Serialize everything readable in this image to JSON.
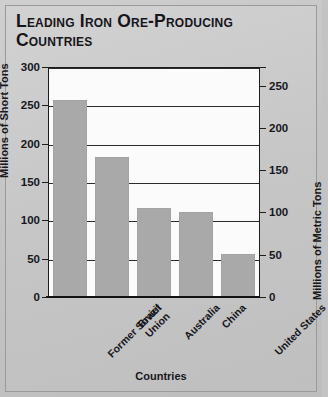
{
  "chart_data": {
    "type": "bar",
    "title": "Leading Iron Ore-Producing Countries",
    "categories": [
      "Former Soviet Union",
      "Brazil",
      "Australia",
      "China",
      "United States"
    ],
    "values": [
      258,
      184,
      118,
      112,
      58
    ],
    "xlabel": "Countries",
    "ylabel": "Millions of Short Tons",
    "ylabel_right": "Millions of Metric Tons",
    "ylim": [
      0,
      300
    ],
    "ylim_right": [
      0,
      272
    ],
    "yticks": [
      0,
      50,
      100,
      150,
      200,
      250,
      300
    ],
    "yticks_right": [
      0,
      50,
      100,
      150,
      200,
      250
    ],
    "ytick_labels": [
      "0",
      "50",
      "100",
      "150",
      "200",
      "250",
      "300"
    ],
    "ytick_labels_right": [
      "0",
      "50",
      "100",
      "150",
      "200",
      "250"
    ],
    "grid": true,
    "legend": false,
    "bar_color": "#a9a9a9",
    "plot_background": "#fbfbfb",
    "figure_background": "#c6c6c6"
  },
  "title": {
    "line1": "Leading Iron Ore-Producing",
    "line2": "Countries"
  },
  "category_labels": [
    "Former Soviet\nUnion",
    "Brazil",
    "Australia",
    "China",
    "United States"
  ]
}
